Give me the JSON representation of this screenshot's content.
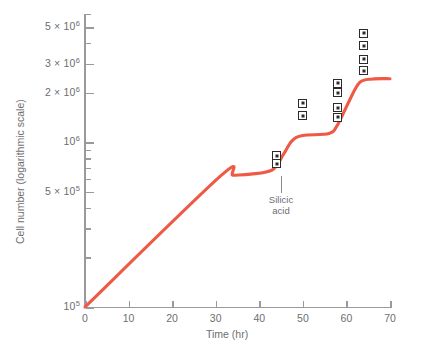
{
  "chart_data": {
    "type": "line",
    "title": "",
    "xlabel": "Time (hr)",
    "ylabel": "Cell number (logarithmic scale)",
    "y_scale": "log",
    "xlim": [
      0,
      70
    ],
    "ylim": [
      100000,
      6000000
    ],
    "grid": false,
    "legend": null,
    "line_color": "#ee5a46",
    "x_ticks": [
      0,
      10,
      20,
      30,
      40,
      50,
      60,
      70
    ],
    "x_tick_labels": [
      "0",
      "10",
      "20",
      "30",
      "40",
      "50",
      "60",
      "70"
    ],
    "y_ticks": [
      100000,
      500000,
      1000000,
      2000000,
      3000000,
      5000000
    ],
    "y_tick_labels": [
      "10⁵",
      "5 × 10⁵",
      "10⁶",
      "2 × 10⁶",
      "3 × 10⁶",
      "5 × 10⁶"
    ],
    "series": [
      {
        "name": "cell number",
        "x": [
          0,
          31,
          34,
          38,
          43,
          45.5,
          47.5,
          50,
          56,
          58,
          60.5,
          63,
          66,
          70
        ],
        "y": [
          100000,
          620000,
          630000,
          640000,
          680000,
          840000,
          1020000,
          1100000,
          1130000,
          1280000,
          1750000,
          2300000,
          2420000,
          2430000
        ]
      }
    ],
    "annotations": [
      {
        "text_line1": "Silicic",
        "text_line2": "acid",
        "x": 45,
        "y": 330000
      }
    ],
    "marker_symbol": "square-with-center-dot",
    "marker_clusters": [
      {
        "x": 44,
        "values": [
          740000,
          830000
        ]
      },
      {
        "x": 50,
        "values": [
          1450000,
          1720000
        ]
      },
      {
        "x": 58,
        "values": [
          1420000,
          1620000,
          2000000,
          2280000
        ]
      },
      {
        "x": 64,
        "values": [
          2720000,
          3200000,
          3850000,
          4600000
        ]
      }
    ]
  },
  "axis_titles": {
    "x": "Time (hr)",
    "y": "Cell number (logarithmic scale)"
  },
  "annotation": {
    "line1": "Silicic",
    "line2": "acid"
  },
  "colors": {
    "curve": "#ee5a46",
    "axis": "#9a9a9c",
    "text": "#6d6e71",
    "marker": "#2b2b2b"
  }
}
